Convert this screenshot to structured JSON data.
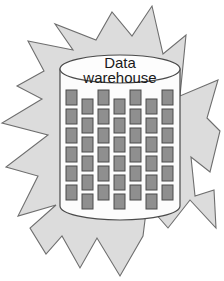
{
  "figure": {
    "background_color": "#ffffff"
  },
  "burst": {
    "name": "starburst-shape",
    "fill_color": "#dcdcdc",
    "stroke_color": "#6e6e6e",
    "points": "152,6 163,54 186,35 180,96 218,80 207,118 220,131 210,172 191,157 195,196 214,190 216,228 190,200 168,228 147,204 143,236 120,276 97,238 80,268 62,236 46,254 30,228 56,205 18,216 38,176 6,167 48,135 2,123 42,99 17,86 44,71 28,41 73,50 55,24 96,40 112,12 132,36"
  },
  "cylinder": {
    "name": "data-warehouse-cylinder",
    "body_fill": "#fcfcfc",
    "top_fill": "#fdfdfd",
    "stroke_color": "#4a4a4a",
    "left_x": 60,
    "right_x": 180,
    "top_y": 55,
    "bottom_y": 220,
    "ellipse_ry": 14,
    "label": {
      "name": "cylinder-label",
      "line1": "Data",
      "line2": "warehouse",
      "color": "#1a1a1a"
    }
  },
  "data_blocks": {
    "name": "data-block-grid",
    "fill_color": "#8f8f8f",
    "stroke_color": "#4a4a4a",
    "columns": 7,
    "rows": 6,
    "block_width": 11,
    "block_height": 15,
    "col_start_x": 66,
    "col_step_x": 16,
    "row_start_y": 90,
    "row_step_y": 19,
    "odd_column_offset_y": 9,
    "count": 42
  }
}
